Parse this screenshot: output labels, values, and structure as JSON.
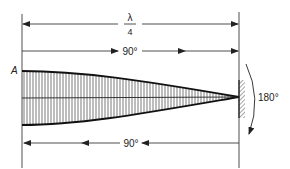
{
  "diagram": {
    "type": "standing-wave-quarter-wavelength-reflection",
    "labels": {
      "wavelength_num": "λ",
      "wavelength_den": "4",
      "forward_phase": "90°",
      "reflection_phase": "180°",
      "return_phase": "90°",
      "point_a": "A"
    },
    "colors": {
      "ink": "#222222",
      "background": "#ffffff"
    }
  }
}
